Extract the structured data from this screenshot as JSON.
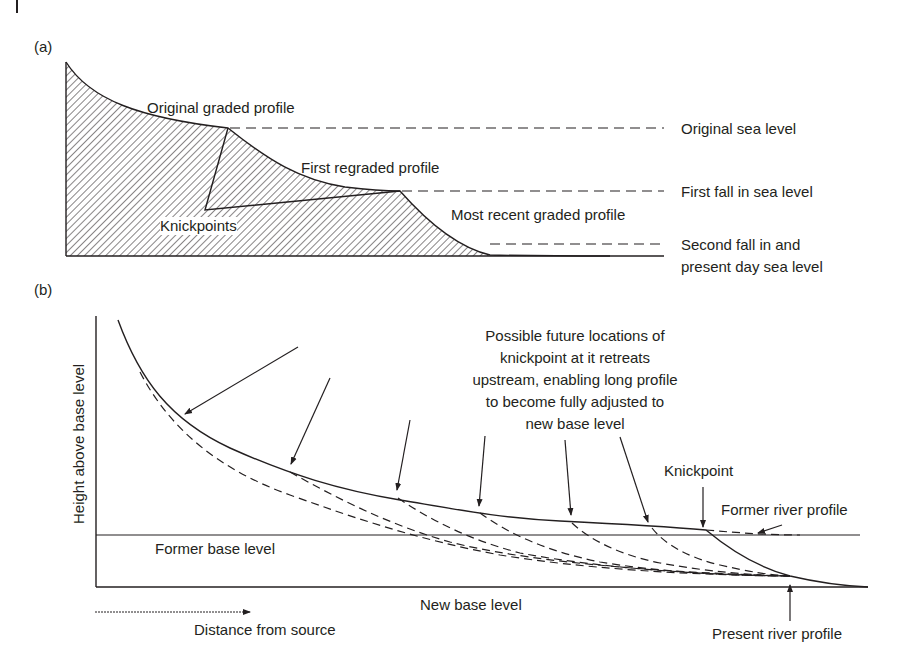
{
  "panel_a": {
    "label": "(a)",
    "profiles": {
      "original": "Original graded profile",
      "first_regraded": "First regraded profile",
      "most_recent": "Most recent graded profile"
    },
    "knickpoints": "Knickpoints",
    "sea_levels": {
      "original": "Original sea level",
      "first_fall": "First fall in sea level",
      "second_fall_line1": "Second fall in and",
      "second_fall_line2": "present day sea level"
    }
  },
  "panel_b": {
    "label": "(b)",
    "y_axis": "Height above base level",
    "x_axis": "Distance from source",
    "former_base_level": "Former base level",
    "new_base_level": "New base level",
    "annotation": [
      "Possible future locations of",
      "knickpoint at it retreats",
      "upstream, enabling long profile",
      "to become fully adjusted to",
      "new base level"
    ],
    "knickpoint": "Knickpoint",
    "former_river_profile": "Former river profile",
    "present_river_profile": "Present river profile"
  },
  "colors": {
    "ink": "#231f20",
    "background": "#ffffff"
  }
}
